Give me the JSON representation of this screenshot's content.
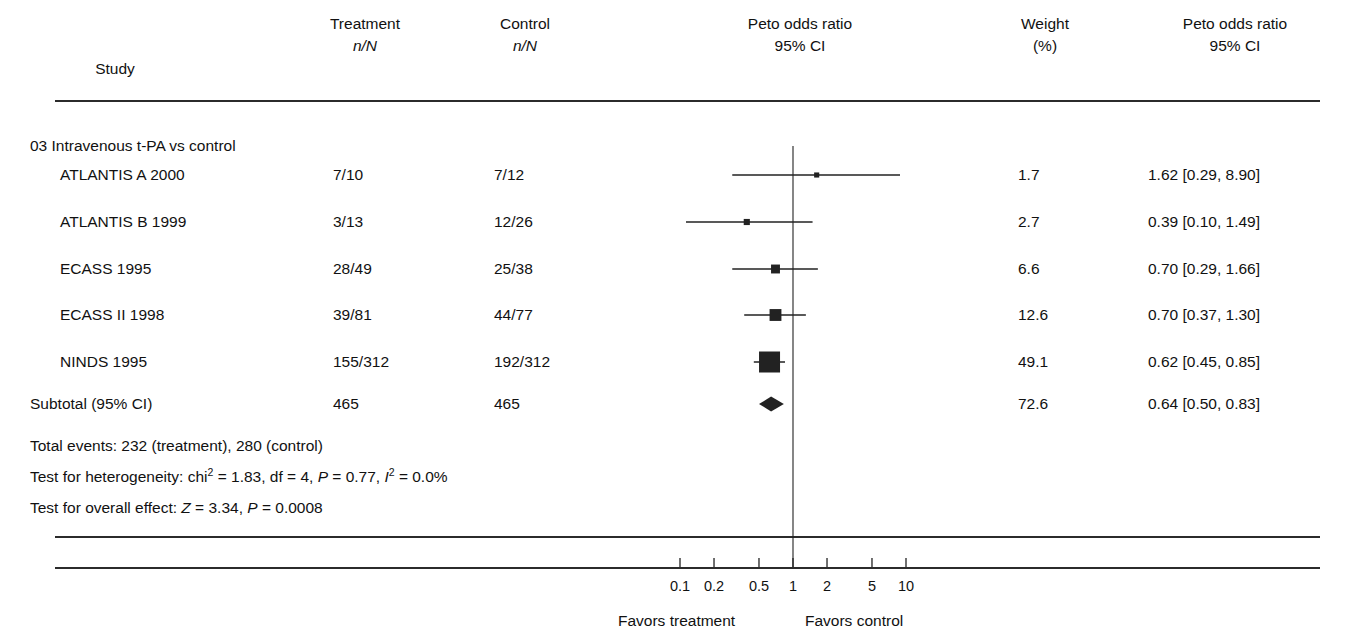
{
  "header": {
    "col_study": "Study",
    "col_treatment_l1": "Treatment",
    "col_treatment_l2": "n/N",
    "col_control_l1": "Control",
    "col_control_l2": "n/N",
    "col_plot_l1": "Peto odds ratio",
    "col_plot_l2": "95% CI",
    "col_weight_l1": "Weight",
    "col_weight_l2": "(%)",
    "col_effect_l1": "Peto odds ratio",
    "col_effect_l2": "95% CI"
  },
  "group_label": "03 Intravenous t-PA vs control",
  "rows": [
    {
      "study": "ATLANTIS A 2000",
      "treatment": "7/10",
      "control": "7/12",
      "weight": "1.7",
      "effect": "1.62 [0.29, 8.90]",
      "or": 1.62,
      "lo": 0.29,
      "hi": 8.9
    },
    {
      "study": "ATLANTIS B 1999",
      "treatment": "3/13",
      "control": "12/26",
      "weight": "2.7",
      "effect": "0.39 [0.10, 1.49]",
      "or": 0.39,
      "lo": 0.1,
      "hi": 1.49
    },
    {
      "study": "ECASS 1995",
      "treatment": "28/49",
      "control": "25/38",
      "weight": "6.6",
      "effect": "0.70 [0.29, 1.66]",
      "or": 0.7,
      "lo": 0.29,
      "hi": 1.66
    },
    {
      "study": "ECASS II 1998",
      "treatment": "39/81",
      "control": "44/77",
      "weight": "12.6",
      "effect": "0.70 [0.37, 1.30]",
      "or": 0.7,
      "lo": 0.37,
      "hi": 1.3
    },
    {
      "study": "NINDS 1995",
      "treatment": "155/312",
      "control": "192/312",
      "weight": "49.1",
      "effect": "0.62 [0.45, 0.85]",
      "or": 0.62,
      "lo": 0.45,
      "hi": 0.85
    }
  ],
  "subtotal": {
    "label": "Subtotal (95% CI)",
    "treatment": "465",
    "control": "465",
    "weight": "72.6",
    "effect": "0.64 [0.50, 0.83]",
    "or": 0.64,
    "lo": 0.5,
    "hi": 0.83
  },
  "notes": {
    "total_events": "Total events: 232 (treatment), 280 (control)",
    "heterogeneity_pre": "Test for heterogeneity: chi",
    "heterogeneity_sup": "2",
    "heterogeneity_mid": " = 1.83, df = 4, ",
    "heterogeneity_p": "P",
    "heterogeneity_pval": " = 0.77, ",
    "heterogeneity_i": "I",
    "heterogeneity_isup": "2",
    "heterogeneity_ival": " = 0.0%",
    "overall_pre": "Test for overall effect: ",
    "overall_z": "Z",
    "overall_zval": " = 3.34, ",
    "overall_p": "P",
    "overall_pval": " = 0.0008"
  },
  "axis": {
    "ticks": [
      "0.1",
      "0.2",
      "0.5",
      "1",
      "2",
      "5",
      "10"
    ],
    "tick_values": [
      0.1,
      0.2,
      0.5,
      1,
      2,
      5,
      10
    ],
    "favors_left": "Favors treatment",
    "favors_right": "Favors control"
  },
  "chart_data": {
    "type": "forest",
    "title": "03 Intravenous t-PA vs control",
    "xlabel": "Peto odds ratio 95% CI",
    "scale": "log",
    "xlim": [
      0.08,
      13
    ],
    "null_line": 1,
    "categories": [
      "ATLANTIS A 2000",
      "ATLANTIS B 1999",
      "ECASS 1995",
      "ECASS II 1998",
      "NINDS 1995",
      "Subtotal (95% CI)"
    ],
    "effect": [
      1.62,
      0.39,
      0.7,
      0.7,
      0.62,
      0.64
    ],
    "ci_lower": [
      0.29,
      0.1,
      0.29,
      0.37,
      0.45,
      0.5
    ],
    "ci_upper": [
      8.9,
      1.49,
      1.66,
      1.3,
      0.85,
      0.83
    ],
    "weights": [
      1.7,
      2.7,
      6.6,
      12.6,
      49.1,
      72.6
    ],
    "treatment_n": [
      "7/10",
      "3/13",
      "28/49",
      "39/81",
      "155/312",
      "465"
    ],
    "control_n": [
      "7/12",
      "12/26",
      "25/38",
      "44/77",
      "192/312",
      "465"
    ],
    "tick_labels": [
      "0.1",
      "0.2",
      "0.5",
      "1",
      "2",
      "5",
      "10"
    ],
    "annotations": [
      "Favors treatment",
      "Favors control"
    ],
    "legend": null,
    "grid": false
  },
  "colors": {
    "ink": "#1a1a1a",
    "rule": "#2b2b2b",
    "marker": "#222222"
  }
}
